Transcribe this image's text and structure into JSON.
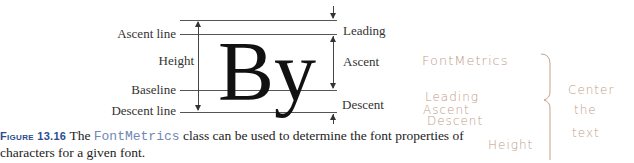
{
  "figure": {
    "glyph_text": "By",
    "left_labels": {
      "ascent_line": "Ascent line",
      "height": "Height",
      "baseline": "Baseline",
      "descent_line": "Descent line"
    },
    "right_labels": {
      "leading": "Leading",
      "ascent": "Ascent",
      "descent": "Descent"
    }
  },
  "caption": {
    "figure_number": "Figure 13.16",
    "text_before": "The ",
    "class_name": "FontMetrics",
    "text_after": " class can be used to determine the font properties of",
    "line2": "characters for a given font."
  },
  "handwritten_notes": {
    "title": "FontMetrics",
    "list": [
      "Leading",
      "Ascent",
      "Descent",
      "Height"
    ],
    "side_note": [
      "Center",
      "the",
      "text"
    ]
  }
}
